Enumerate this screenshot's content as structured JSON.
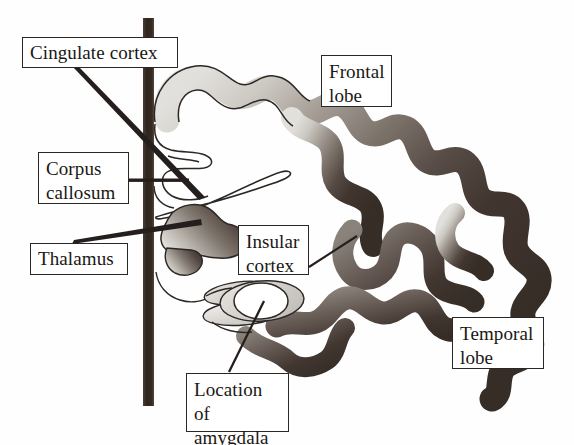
{
  "figure": {
    "kind": "anatomical-diagram",
    "width": 574,
    "height": 445,
    "background_color": "#ffffff"
  },
  "colors": {
    "outline": "#2b2724",
    "label_border": "#2b2724",
    "label_text": "#1a1714",
    "label_fill": "#ffffff",
    "midline_bar": "#3a2f28",
    "cortex_light": "#d9d7d2",
    "cortex_mid": "#8f8880",
    "cortex_dark": "#3b312c",
    "thalamus_light": "#cfcac4",
    "thalamus_dark": "#4a403a",
    "amygdala_fill": "#ffffff",
    "amygdala_shade": "#d4d1cb",
    "leader_line": "#241f1c"
  },
  "labels": [
    {
      "id": "cingulate",
      "text": "Cingulate cortex",
      "lines": 1,
      "box": {
        "x": 22,
        "y": 37,
        "w": 156,
        "h": 31
      },
      "leader": {
        "from_x": 73,
        "from_y": 68,
        "to_x": 212,
        "to_y": 243,
        "style": "thick-wedge"
      }
    },
    {
      "id": "corpus-callosum",
      "text": "Corpus\ncallosum",
      "lines": 2,
      "box": {
        "x": 38,
        "y": 152,
        "w": 91,
        "h": 52
      },
      "leader": {
        "from_x": 129,
        "from_y": 180,
        "to_x": 189,
        "to_y": 180,
        "style": "horizontal-rule"
      }
    },
    {
      "id": "thalamus",
      "text": "Thalamus",
      "lines": 1,
      "box": {
        "x": 30,
        "y": 243,
        "w": 98,
        "h": 32
      },
      "leader": {
        "from_x": 83,
        "from_y": 243,
        "to_x": 200,
        "to_y": 222,
        "style": "thick-wedge"
      }
    },
    {
      "id": "insular-cortex",
      "text": "Insular\ncortex",
      "lines": 2,
      "box": {
        "x": 238,
        "y": 225,
        "w": 71,
        "h": 50
      },
      "leader": {
        "from_x": 309,
        "from_y": 266,
        "to_x": 356,
        "to_y": 238,
        "style": "thin-line"
      }
    },
    {
      "id": "location-of-amygdala",
      "text": "Location of\namygdala",
      "lines": 2,
      "box": {
        "x": 186,
        "y": 373,
        "w": 103,
        "h": 59
      },
      "leader": {
        "from_x": 228,
        "from_y": 373,
        "to_x": 264,
        "to_y": 303,
        "style": "thin-line"
      }
    },
    {
      "id": "frontal-lobe",
      "text": "Frontal\nlobe",
      "lines": 2,
      "box": {
        "x": 321,
        "y": 55,
        "w": 71,
        "h": 52
      },
      "leader": null
    },
    {
      "id": "temporal-lobe",
      "text": "Temporal\nlobe",
      "lines": 2,
      "box": {
        "x": 452,
        "y": 317,
        "w": 92,
        "h": 52
      },
      "leader": null
    }
  ],
  "structures": [
    {
      "id": "midline-bar",
      "name": "Midline / interhemispheric bar",
      "x": 143,
      "y": 18,
      "w": 11,
      "h": 388
    },
    {
      "id": "cortical-ribbon",
      "name": "Convoluted cerebral cortex ribbon (gyri and sulci)"
    },
    {
      "id": "thalamus-body",
      "name": "Thalamus"
    },
    {
      "id": "corpus-callosum-body",
      "name": "Corpus callosum"
    },
    {
      "id": "amygdala-region",
      "name": "Amygdala region ovals"
    }
  ],
  "label_text": {
    "cingulate": "Cingulate cortex",
    "corpus": "Corpus\ncallosum",
    "thalamus": "Thalamus",
    "insular": "Insular\ncortex",
    "amygdala": "Location of\namygdala",
    "frontal": "Frontal\nlobe",
    "temporal": "Temporal\nlobe"
  }
}
